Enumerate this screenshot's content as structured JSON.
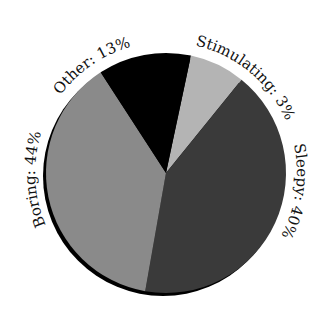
{
  "chart_data": {
    "type": "pie",
    "title": "",
    "labels": [
      "Stimulating",
      "Sleepy",
      "Boring",
      "Other"
    ],
    "values": [
      3,
      40,
      44,
      13
    ],
    "unit": "%",
    "slices": [
      {
        "name": "Stimulating",
        "value": 3,
        "label": "Stimulating: 3%",
        "color": "#b4b4b4",
        "start_deg": 12,
        "end_deg": 39
      },
      {
        "name": "Sleepy",
        "value": 40,
        "label": "Sleepy: 40%",
        "color": "#3a3a3a",
        "start_deg": 39,
        "end_deg": 190
      },
      {
        "name": "Boring",
        "value": 44,
        "label": "Boring: 44%",
        "color": "#8a8a8a",
        "start_deg": 190,
        "end_deg": 327
      },
      {
        "name": "Other",
        "value": 13,
        "label": "Other: 13%",
        "color": "#000000",
        "start_deg": 327,
        "end_deg": 372
      }
    ],
    "legend": "none",
    "labels_curved_on_circumference": true,
    "shadow_color": "#000000"
  },
  "labels": {
    "stimulating": "Stimulating: 3%",
    "sleepy": "Sleepy: 40%",
    "boring": "Boring: 44%",
    "other": "Other: 13%"
  }
}
